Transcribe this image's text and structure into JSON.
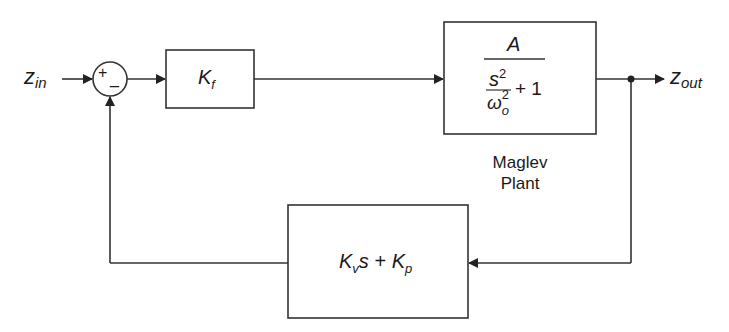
{
  "diagram": {
    "type": "block_diagram",
    "input_signal": {
      "base": "z",
      "sub": "in"
    },
    "output_signal": {
      "base": "z",
      "sub": "out"
    },
    "summing_junction": {
      "plus_sign": "+",
      "minus_sign": "_"
    },
    "forward_gain": {
      "base": "K",
      "sub": "f"
    },
    "plant": {
      "numerator": "A",
      "denominator": {
        "inner_num": "s",
        "inner_num_exp": "2",
        "inner_den": "ω",
        "inner_den_sub": "o",
        "inner_den_exp": "2",
        "plus": "+ 1"
      },
      "caption_line1": "Maglev",
      "caption_line2": "Plant"
    },
    "feedback": {
      "term1_base": "K",
      "term1_sub": "v",
      "term1_var": "s",
      "plus": "+",
      "term2_base": "K",
      "term2_sub": "p"
    },
    "colors": {
      "line": "#333333",
      "background": "#ffffff"
    }
  }
}
